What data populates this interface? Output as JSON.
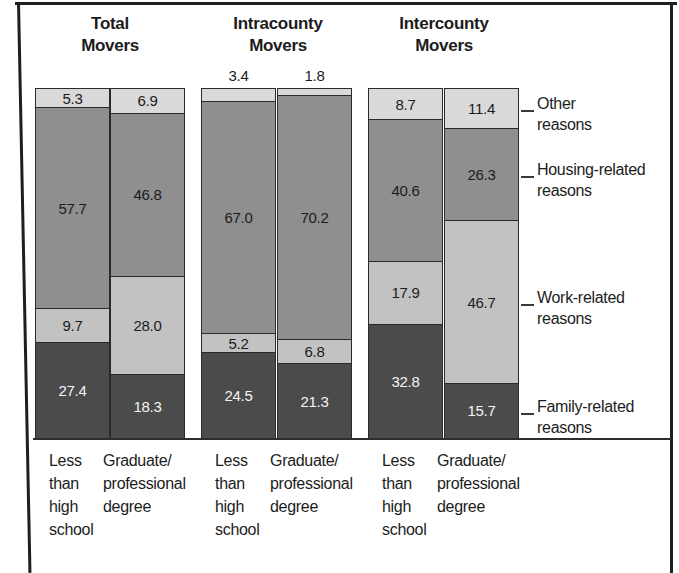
{
  "figure": {
    "background": "#ffffff",
    "frame_color": "#1f1f1f",
    "text_color": "#1c1c1c"
  },
  "chart_data": {
    "type": "bar",
    "subtype": "100-percent-stacked-column",
    "unit": "percent",
    "grid": false,
    "legend_position": "right",
    "groups": [
      {
        "title": "Total\nMovers"
      },
      {
        "title": "Intracounty\nMovers"
      },
      {
        "title": "Intercounty\nMovers"
      }
    ],
    "categories_per_group": [
      "Less\nthan\nhigh\nschool",
      "Graduate/\nprofessional\ndegree"
    ],
    "bars": [
      "Total Movers - Less than high school",
      "Total Movers - Graduate/professional degree",
      "Intracounty Movers - Less than high school",
      "Intracounty Movers - Graduate/professional degree",
      "Intercounty Movers - Less than high school",
      "Intercounty Movers - Graduate/professional degree"
    ],
    "series": [
      {
        "name": "Other\nreasons",
        "color": "#d9d9d9",
        "text_color": "#1c1c1c",
        "values": [
          5.3,
          6.9,
          3.4,
          1.8,
          8.7,
          11.4
        ]
      },
      {
        "name": "Housing-related\nreasons",
        "color": "#8f8f8f",
        "text_color": "#1c1c1c",
        "values": [
          57.7,
          46.8,
          67.0,
          70.2,
          40.6,
          26.3
        ]
      },
      {
        "name": "Work-related\nreasons",
        "color": "#c2c2c2",
        "text_color": "#1c1c1c",
        "values": [
          9.7,
          28.0,
          5.2,
          6.8,
          17.9,
          46.7
        ]
      },
      {
        "name": "Family-related\nreasons",
        "color": "#4b4b4b",
        "text_color": "#f4f4f4",
        "values": [
          27.4,
          18.3,
          24.5,
          21.3,
          32.8,
          15.7
        ]
      }
    ],
    "outside_label_threshold": 4
  }
}
